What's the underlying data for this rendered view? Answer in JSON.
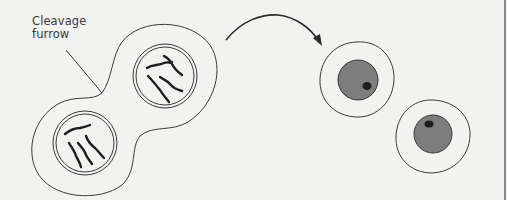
{
  "figure": {
    "label": {
      "line1": "Cleavage",
      "line2": "furrow"
    },
    "stages": [
      {
        "name": "dividing-cell",
        "description": "Cell undergoing cytokinesis with two nuclei containing chromosomes"
      },
      {
        "name": "daughter-cells",
        "description": "Two separated daughter cells, each with nucleus and nucleolus"
      }
    ],
    "colors": {
      "background": "#f2f2f1",
      "line": "#3a3a3a",
      "nucleus_fill": "#7d7d7d",
      "nucleolus_fill": "#1e1e1e"
    }
  }
}
